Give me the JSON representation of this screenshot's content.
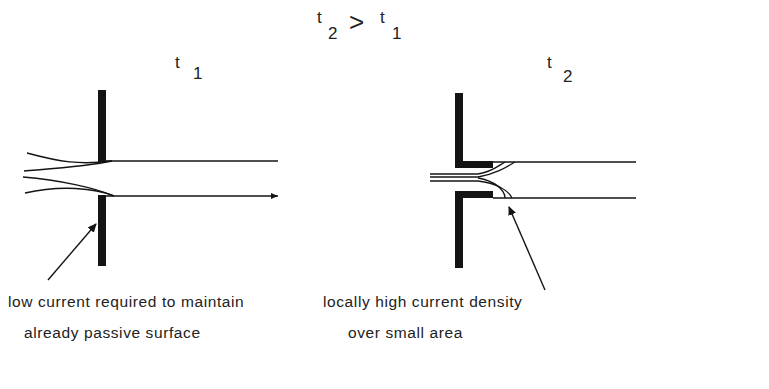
{
  "figure": {
    "heading": {
      "left_var": "t",
      "left_sub": "2",
      "relation": ">",
      "right_var": "t",
      "right_sub": "1"
    },
    "panels": [
      {
        "id": "t1",
        "var": "t",
        "sub": "1",
        "caption_line1": "low current required to maintain",
        "caption_line2": "already passive surface"
      },
      {
        "id": "t2",
        "var": "t",
        "sub": "2",
        "caption_line1": "locally high current density",
        "caption_line2": "over small area"
      }
    ],
    "colors": {
      "ink": "#141414",
      "background": "#ffffff"
    }
  }
}
